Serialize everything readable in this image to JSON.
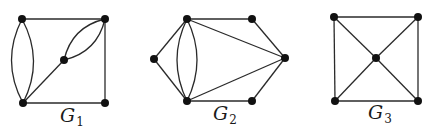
{
  "figure": {
    "colors": {
      "edge": "#2a2a2a",
      "node": "#111111",
      "background": "#ffffff"
    },
    "graphs": [
      {
        "id": "G1",
        "label": "G",
        "subscript": "1",
        "label_pos": [
          60,
          122
        ],
        "nodes": [
          {
            "id": "a",
            "x": 22,
            "y": 19
          },
          {
            "id": "b",
            "x": 105,
            "y": 19
          },
          {
            "id": "c",
            "x": 64,
            "y": 60
          },
          {
            "id": "d",
            "x": 23,
            "y": 103
          },
          {
            "id": "e",
            "x": 105,
            "y": 103
          }
        ],
        "edges": [
          {
            "from": "a",
            "to": "b",
            "type": "straight"
          },
          {
            "from": "b",
            "to": "e",
            "type": "straight"
          },
          {
            "from": "d",
            "to": "e",
            "type": "straight"
          },
          {
            "from": "d",
            "to": "c",
            "type": "straight"
          },
          {
            "from": "a",
            "to": "d",
            "type": "curve",
            "bend": -11
          },
          {
            "from": "a",
            "to": "d",
            "type": "curve",
            "bend": 11
          },
          {
            "from": "c",
            "to": "b",
            "type": "curve",
            "bend": -9
          },
          {
            "from": "c",
            "to": "b",
            "type": "curve",
            "bend": 9
          }
        ]
      },
      {
        "id": "G2",
        "label": "G",
        "subscript": "2",
        "label_pos": [
          213,
          120
        ],
        "nodes": [
          {
            "id": "a",
            "x": 187,
            "y": 19
          },
          {
            "id": "b",
            "x": 252,
            "y": 19
          },
          {
            "id": "c",
            "x": 285,
            "y": 58
          },
          {
            "id": "d",
            "x": 252,
            "y": 101
          },
          {
            "id": "e",
            "x": 187,
            "y": 101
          },
          {
            "id": "f",
            "x": 154,
            "y": 59
          }
        ],
        "edges": [
          {
            "from": "a",
            "to": "b",
            "type": "straight"
          },
          {
            "from": "b",
            "to": "c",
            "type": "straight"
          },
          {
            "from": "c",
            "to": "d",
            "type": "straight"
          },
          {
            "from": "d",
            "to": "e",
            "type": "straight"
          },
          {
            "from": "e",
            "to": "f",
            "type": "straight"
          },
          {
            "from": "f",
            "to": "a",
            "type": "straight"
          },
          {
            "from": "a",
            "to": "c",
            "type": "straight"
          },
          {
            "from": "e",
            "to": "c",
            "type": "straight"
          },
          {
            "from": "a",
            "to": "e",
            "type": "curve",
            "bend": -10
          },
          {
            "from": "a",
            "to": "e",
            "type": "curve",
            "bend": 10
          }
        ]
      },
      {
        "id": "G3",
        "label": "G",
        "subscript": "3",
        "label_pos": [
          368,
          119
        ],
        "nodes": [
          {
            "id": "a",
            "x": 334,
            "y": 17
          },
          {
            "id": "b",
            "x": 418,
            "y": 17
          },
          {
            "id": "c",
            "x": 376,
            "y": 58
          },
          {
            "id": "d",
            "x": 335,
            "y": 101
          },
          {
            "id": "e",
            "x": 418,
            "y": 101
          }
        ],
        "edges": [
          {
            "from": "a",
            "to": "b",
            "type": "straight"
          },
          {
            "from": "b",
            "to": "e",
            "type": "straight"
          },
          {
            "from": "e",
            "to": "d",
            "type": "straight"
          },
          {
            "from": "d",
            "to": "a",
            "type": "straight"
          },
          {
            "from": "a",
            "to": "c",
            "type": "straight"
          },
          {
            "from": "b",
            "to": "c",
            "type": "straight"
          },
          {
            "from": "d",
            "to": "c",
            "type": "straight"
          },
          {
            "from": "e",
            "to": "c",
            "type": "straight"
          }
        ]
      }
    ]
  }
}
